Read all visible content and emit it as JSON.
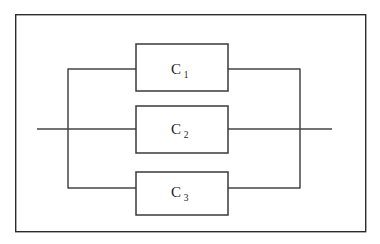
{
  "diagram": {
    "type": "circuit-schematic",
    "background_color": "#ffffff",
    "line_color": "#454545",
    "frame": {
      "name": "outer-border",
      "x": 15,
      "y": 14,
      "width": 351,
      "height": 218,
      "stroke": "#2b2b2b"
    },
    "components": [
      {
        "id": "c1",
        "label": "C",
        "subscript": "1",
        "box": {
          "x": 136,
          "y": 44,
          "width": 92,
          "height": 47
        },
        "lead_y": 69
      },
      {
        "id": "c2",
        "label": "C",
        "subscript": "2",
        "box": {
          "x": 136,
          "y": 106,
          "width": 92,
          "height": 47
        },
        "lead_y": 129
      },
      {
        "id": "c3",
        "label": "C",
        "subscript": "3",
        "box": {
          "x": 136,
          "y": 172,
          "width": 92,
          "height": 43
        },
        "lead_y": 188
      }
    ],
    "bus": {
      "left_x": 68,
      "right_x": 300,
      "top_y": 69,
      "bottom_y": 188,
      "mid_y": 129
    },
    "terminals": {
      "input_lead_start_x": 37,
      "output_lead_end_x": 332,
      "lead_y": 129
    }
  }
}
